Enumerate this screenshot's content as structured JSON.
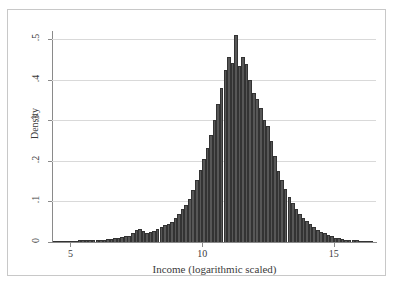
{
  "chart_data": {
    "type": "bar",
    "title": "",
    "subtitle": "",
    "xlabel": "Income (logarithmic scaled)",
    "ylabel": "Density",
    "xlim": [
      4.3,
      16.6
    ],
    "ylim": [
      0,
      0.52
    ],
    "grid": true,
    "legend": null,
    "xticks": [
      "5",
      "10",
      "15"
    ],
    "xtick_values": [
      5,
      10,
      15
    ],
    "yticks": [
      "0",
      ".1",
      ".2",
      ".3",
      ".4",
      ".5"
    ],
    "ytick_values": [
      0,
      0.1,
      0.2,
      0.3,
      0.4,
      0.5
    ],
    "bar_color": "#575757",
    "bar_edge_color": "#333333",
    "grid_color": "#d9d9d9",
    "axis_color": "#8a8a8a",
    "frame_color": "#c8c8c8",
    "bin_width": 0.135,
    "x": [
      4.4,
      4.53,
      4.67,
      4.8,
      4.94,
      5.07,
      5.21,
      5.34,
      5.48,
      5.61,
      5.75,
      5.88,
      6.02,
      6.15,
      6.29,
      6.42,
      6.56,
      6.69,
      6.83,
      6.96,
      7.1,
      7.23,
      7.37,
      7.5,
      7.64,
      7.77,
      7.91,
      8.04,
      8.18,
      8.31,
      8.45,
      8.58,
      8.72,
      8.85,
      8.99,
      9.12,
      9.26,
      9.39,
      9.53,
      9.66,
      9.8,
      9.93,
      10.07,
      10.2,
      10.34,
      10.47,
      10.61,
      10.74,
      10.88,
      11.01,
      11.15,
      11.28,
      11.42,
      11.55,
      11.69,
      11.82,
      11.96,
      12.09,
      12.23,
      12.36,
      12.5,
      12.63,
      12.77,
      12.9,
      13.04,
      13.17,
      13.31,
      13.44,
      13.58,
      13.71,
      13.85,
      13.98,
      14.12,
      14.25,
      14.39,
      14.52,
      14.66,
      14.79,
      14.93,
      15.06,
      15.2,
      15.33,
      15.47,
      15.6,
      15.74,
      15.87,
      16.01,
      16.14,
      16.28,
      16.41
    ],
    "values": [
      0.002,
      0.002,
      0.003,
      0.002,
      0.003,
      0.002,
      0.003,
      0.004,
      0.004,
      0.005,
      0.005,
      0.004,
      0.005,
      0.006,
      0.006,
      0.007,
      0.008,
      0.009,
      0.01,
      0.012,
      0.014,
      0.016,
      0.022,
      0.03,
      0.031,
      0.026,
      0.022,
      0.024,
      0.027,
      0.031,
      0.037,
      0.042,
      0.045,
      0.05,
      0.058,
      0.07,
      0.082,
      0.09,
      0.105,
      0.128,
      0.152,
      0.178,
      0.205,
      0.232,
      0.263,
      0.3,
      0.34,
      0.38,
      0.425,
      0.455,
      0.44,
      0.51,
      0.435,
      0.455,
      0.438,
      0.4,
      0.368,
      0.352,
      0.33,
      0.3,
      0.285,
      0.25,
      0.212,
      0.175,
      0.152,
      0.13,
      0.112,
      0.095,
      0.082,
      0.07,
      0.06,
      0.052,
      0.044,
      0.036,
      0.03,
      0.025,
      0.021,
      0.017,
      0.014,
      0.011,
      0.009,
      0.007,
      0.006,
      0.005,
      0.004,
      0.004,
      0.003,
      0.003,
      0.002,
      0.002
    ]
  }
}
